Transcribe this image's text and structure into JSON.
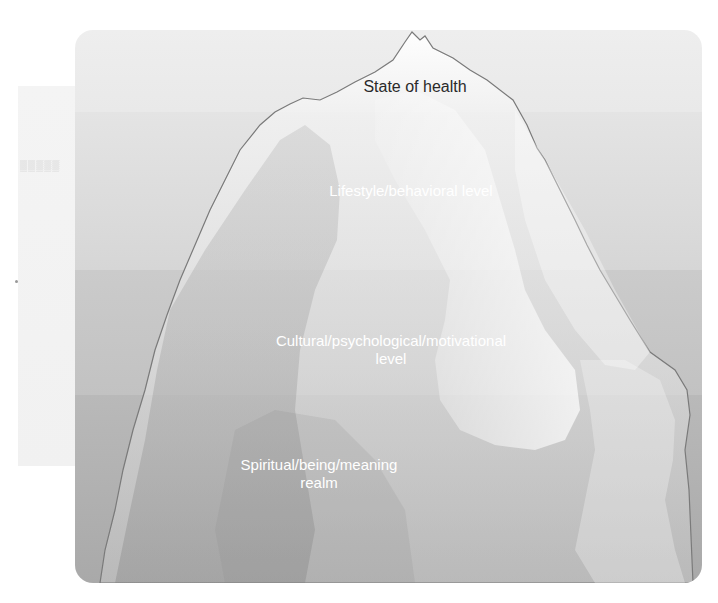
{
  "diagram": {
    "type": "iceberg-model",
    "levels": [
      {
        "label": "State of health",
        "position": "tip above waterline",
        "color": "#eeeeee"
      },
      {
        "label": "Lifestyle/behavioral level",
        "position": "upper submerged",
        "color": "#dcdcdc"
      },
      {
        "label_line1": "Cultural/psychological/motivational",
        "label_line2": "level",
        "position": "middle submerged",
        "color": "#c6c6c6"
      },
      {
        "label_line1": "Spiritual/being/meaning",
        "label_line2": "realm",
        "position": "deepest",
        "color": "#b0b0b0"
      }
    ]
  },
  "colors": {
    "ice_light": "#f4f4f4",
    "ice_outline": "#7a7a7a",
    "label_light": "#ffffff",
    "label_dark": "#2a2a2a"
  }
}
